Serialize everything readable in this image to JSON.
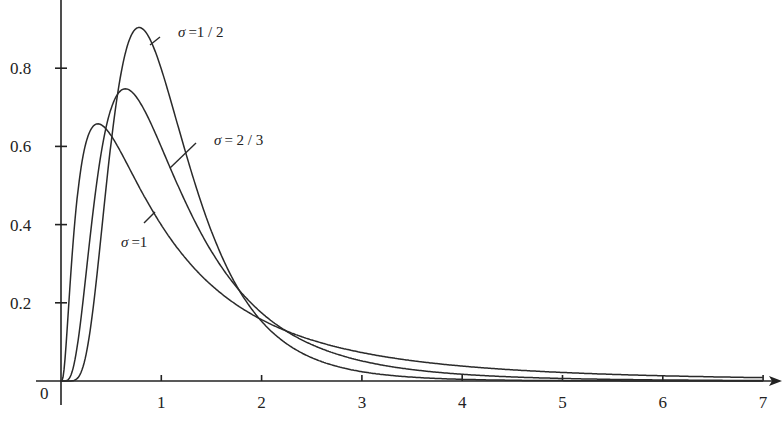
{
  "chart_data": {
    "type": "line",
    "title": "",
    "xlabel": "",
    "ylabel": "",
    "xlim": [
      0,
      7
    ],
    "ylim": [
      0,
      0.92
    ],
    "grid": false,
    "legend": "none (inline annotations)",
    "x_ticks": [
      1,
      2,
      3,
      4,
      5,
      6,
      7
    ],
    "x_tick_labels": [
      "1",
      "2",
      "3",
      "4",
      "5",
      "6",
      "7"
    ],
    "y_ticks": [
      0.2,
      0.4,
      0.6,
      0.8
    ],
    "y_tick_labels": [
      "0.2",
      "0.4",
      "0.6",
      "0.8"
    ],
    "origin_label": "0",
    "x": [
      0.0,
      0.1,
      0.2,
      0.3,
      0.4,
      0.5,
      0.6,
      0.7,
      0.8,
      0.9,
      1.0,
      1.2,
      1.4,
      1.6,
      1.8,
      2.0,
      2.5,
      3.0,
      3.5,
      4.0,
      5.0,
      6.0,
      7.0
    ],
    "series": [
      {
        "name": "σ = 1/2",
        "sigma": 0.5,
        "peak": {
          "x": 0.78,
          "y": 0.9
        },
        "values": [
          0.0,
          0.0,
          0.022,
          0.282,
          0.634,
          0.849,
          0.904,
          0.858,
          0.77,
          0.667,
          0.564,
          0.385,
          0.249,
          0.156,
          0.096,
          0.059,
          0.017,
          0.005,
          0.002,
          0.001,
          0.0,
          0.0,
          0.0
        ]
      },
      {
        "name": "σ = 2/3",
        "sigma": 0.6667,
        "peak": {
          "x": 0.64,
          "y": 0.75
        },
        "values": [
          0.0,
          0.001,
          0.114,
          0.429,
          0.664,
          0.745,
          0.745,
          0.703,
          0.643,
          0.578,
          0.514,
          0.402,
          0.311,
          0.241,
          0.186,
          0.145,
          0.081,
          0.047,
          0.028,
          0.018,
          0.007,
          0.003,
          0.001
        ]
      },
      {
        "name": "σ = 1",
        "sigma": 1.0,
        "peak": {
          "x": 0.37,
          "y": 0.66
        },
        "values": [
          0.0,
          0.281,
          0.545,
          0.644,
          0.655,
          0.627,
          0.583,
          0.536,
          0.489,
          0.444,
          0.399,
          0.328,
          0.269,
          0.221,
          0.183,
          0.157,
          0.104,
          0.073,
          0.053,
          0.039,
          0.024,
          0.015,
          0.01
        ]
      }
    ],
    "annotations": [
      {
        "text": "σ = 1/2",
        "symbol": "σ",
        "value": "=1 / 2",
        "near_x": 0.9,
        "near_y": 0.88
      },
      {
        "text": "σ = 2/3",
        "symbol": "σ",
        "value": "= 2 / 3",
        "near_x": 1.25,
        "near_y": 0.6
      },
      {
        "text": "σ = 1",
        "symbol": "σ",
        "value": "=1",
        "near_x": 0.9,
        "near_y": 0.4
      }
    ]
  }
}
